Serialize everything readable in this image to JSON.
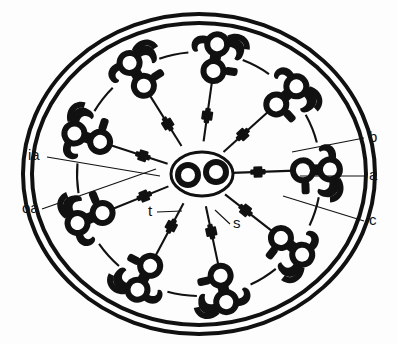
{
  "figure": {
    "background_color": "#fdfdfd",
    "ink_color": "#111111"
  },
  "labels": [
    {
      "key": "ia",
      "text": "ia",
      "meaning": "inner dynein arm",
      "x": 28,
      "y": 160,
      "anchor": "start"
    },
    {
      "key": "oa",
      "text": "oa",
      "meaning": "outer dynein arm",
      "x": 22,
      "y": 213,
      "anchor": "start"
    },
    {
      "key": "b",
      "text": "b",
      "meaning": "B-subfiber",
      "x": 369,
      "y": 142,
      "anchor": "start"
    },
    {
      "key": "a",
      "text": "a",
      "meaning": "A-subfiber",
      "x": 369,
      "y": 180,
      "anchor": "start"
    },
    {
      "key": "c",
      "text": "c",
      "meaning": "nexin link",
      "x": 369,
      "y": 225,
      "anchor": "start"
    },
    {
      "key": "t",
      "text": "t",
      "meaning": "spoke head",
      "x": 148,
      "y": 216,
      "anchor": "start"
    },
    {
      "key": "s",
      "text": "s",
      "meaning": "radial spoke",
      "x": 233,
      "y": 228,
      "anchor": "start"
    }
  ],
  "leader_lines": [
    {
      "key": "ia",
      "x1": 47,
      "y1": 157,
      "x2": 160,
      "y2": 176
    },
    {
      "key": "oa",
      "x1": 42,
      "y1": 209,
      "x2": 156,
      "y2": 169
    },
    {
      "key": "b",
      "x1": 364,
      "y1": 138,
      "x2": 292,
      "y2": 152
    },
    {
      "key": "a",
      "x1": 364,
      "y1": 176,
      "x2": 300,
      "y2": 176
    },
    {
      "key": "c",
      "x1": 364,
      "y1": 221,
      "x2": 283,
      "y2": 196
    },
    {
      "key": "t",
      "x1": 157,
      "y1": 212,
      "x2": 182,
      "y2": 211
    },
    {
      "key": "s",
      "x1": 230,
      "y1": 224,
      "x2": 215,
      "y2": 210
    }
  ],
  "structure": {
    "membrane_outer": {
      "cx": 199,
      "cy": 174,
      "rx": 176,
      "ry": 160,
      "stroke_width": 4
    },
    "membrane_inner": {
      "cx": 199,
      "cy": 174,
      "rx": 168,
      "ry": 152,
      "stroke_width": 4
    },
    "central_sheath": {
      "cx": 202,
      "cy": 174,
      "rx": 31,
      "ry": 22,
      "stroke_width": 3
    },
    "central_pair": [
      {
        "name": "c1",
        "cx": 188,
        "cy": 174,
        "r_outer": 13,
        "r_inner": 7
      },
      {
        "name": "c2",
        "cx": 216,
        "cy": 172,
        "r_outer": 13,
        "r_inner": 7
      }
    ],
    "doublet_count": 9,
    "doublet_ring_radius": 118,
    "spoke_count": 9,
    "spoke_head_size": 9,
    "doublet_subfiber_radius_outer": 13,
    "doublet_subfiber_radius_inner": 7
  }
}
